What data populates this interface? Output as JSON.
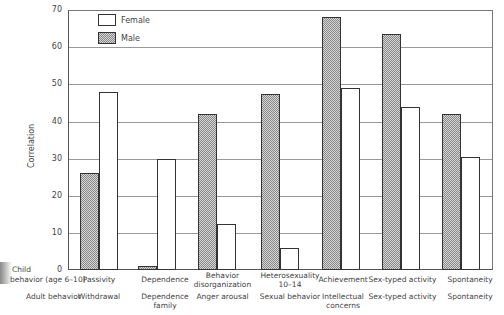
{
  "chart_data": {
    "type": "bar",
    "title": "",
    "xlabel": "",
    "ylabel": "Correlation",
    "ylim": [
      0,
      70
    ],
    "yticks": [
      "0",
      "10",
      "20",
      "30",
      "40",
      "50",
      "60",
      "70"
    ],
    "grid": true,
    "legend": {
      "position": "upper-left",
      "entries": [
        "Female",
        "Male"
      ]
    },
    "row_labels": {
      "child": "Child behavior (age 6-10)",
      "child_line1": "Child",
      "child_line2": "behavior (age 6-10)",
      "adult": "Adult behavior"
    },
    "categories": [
      {
        "child": "Passivity",
        "adult": "Withdrawal"
      },
      {
        "child": "Dependence",
        "adult": "Dependence family"
      },
      {
        "child": "Behavior disorganization",
        "adult": "Anger arousal"
      },
      {
        "child": "Heterosexuality 10-14",
        "adult": "Sexual behavior"
      },
      {
        "child": "Achievement",
        "adult": "Intellectual concerns"
      },
      {
        "child": "Sex-typed activity",
        "adult": "Sex-typed activity"
      },
      {
        "child": "Spontaneity",
        "adult": "Spontaneity"
      }
    ],
    "series": [
      {
        "name": "Male",
        "values": [
          26,
          1,
          42,
          47.5,
          68,
          63.5,
          42
        ]
      },
      {
        "name": "Female",
        "values": [
          48,
          30,
          12.5,
          6,
          49,
          44,
          30.5
        ]
      }
    ]
  },
  "labels": {
    "ylabel": "Correlation",
    "legend_female": "Female",
    "legend_male": "Male",
    "child_line1": "Child",
    "child_line2": "behavior (age 6–10)",
    "adult": "Adult behavior",
    "ticks": [
      "0",
      "10",
      "20",
      "30",
      "40",
      "50",
      "60",
      "70"
    ],
    "cats": [
      {
        "c1": "Passivity",
        "c2": "",
        "a1": "Withdrawal",
        "a2": ""
      },
      {
        "c1": "Dependence",
        "c2": "",
        "a1": "Dependence",
        "a2": "family"
      },
      {
        "c1": "Behavior",
        "c2": "disorganization",
        "a1": "Anger arousal",
        "a2": ""
      },
      {
        "c1": "Heterosexuality",
        "c2": "10–14",
        "a1": "Sexual behavior",
        "a2": ""
      },
      {
        "c1": "Achievement",
        "c2": "",
        "a1": "Intellectual",
        "a2": "concerns"
      },
      {
        "c1": "Sex-typed activity",
        "c2": "",
        "a1": "Sex-typed activity",
        "a2": ""
      },
      {
        "c1": "Spontaneity",
        "c2": "",
        "a1": "Spontaneity",
        "a2": ""
      }
    ]
  }
}
